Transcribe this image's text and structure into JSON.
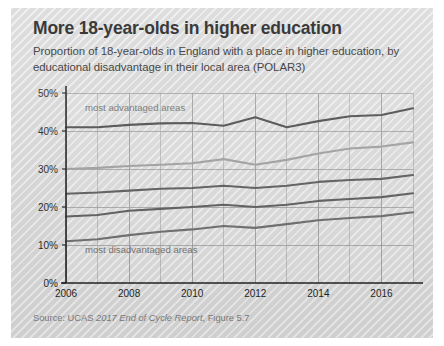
{
  "card": {
    "title": "More 18-year-olds in higher education",
    "subtitle": "Proportion of 18-year-olds in England with a place in higher education, by educational disadvantage in their local area (POLAR3)",
    "source_prefix": "Source: UCAS ",
    "source_italic": "2017 End of Cycle Report",
    "source_suffix": ", Figure 5.7",
    "background_color": "#d7d7d7"
  },
  "chart_data": {
    "type": "line",
    "title": "More 18-year-olds in higher education",
    "subtitle": "Proportion of 18-year-olds in England with a place in higher education, by educational disadvantage in their local area (POLAR3)",
    "xlabel": "",
    "ylabel": "",
    "x": [
      2006,
      2007,
      2008,
      2009,
      2010,
      2011,
      2012,
      2013,
      2014,
      2015,
      2016,
      2017
    ],
    "xlim": [
      2006,
      2017
    ],
    "ylim": [
      0,
      50
    ],
    "xticks": [
      2006,
      2008,
      2010,
      2012,
      2014,
      2016
    ],
    "xticklabels": [
      "2006",
      "2008",
      "2010",
      "2012",
      "2014",
      "2016"
    ],
    "yticks": [
      0,
      10,
      20,
      30,
      40,
      50
    ],
    "yticklabels": [
      "0%",
      "10%",
      "20%",
      "30%",
      "40%",
      "50%"
    ],
    "grid": true,
    "legend_position": "inline-annotations",
    "annotations": [
      {
        "text": "most advantaged areas",
        "x": 2006.6,
        "y": 45.3
      },
      {
        "text": "most disadvantaged areas",
        "x": 2006.6,
        "y": 8.0
      }
    ],
    "series": [
      {
        "name": "Quintile 5 (most advantaged areas)",
        "color": "#4a4a4a",
        "width": 2.1,
        "values": [
          41.0,
          41.0,
          41.6,
          42.0,
          42.1,
          41.4,
          43.6,
          41.0,
          42.6,
          43.9,
          44.2,
          46.0
        ]
      },
      {
        "name": "Quintile 4",
        "color": "#9e9e9e",
        "width": 2.1,
        "values": [
          30.0,
          30.3,
          30.8,
          31.1,
          31.5,
          32.6,
          31.1,
          32.4,
          34.1,
          35.4,
          35.9,
          37.0
        ]
      },
      {
        "name": "Quintile 3",
        "color": "#5a5a5a",
        "width": 2.1,
        "values": [
          23.5,
          23.8,
          24.3,
          24.8,
          25.0,
          25.6,
          25.0,
          25.6,
          26.6,
          27.1,
          27.4,
          28.4
        ]
      },
      {
        "name": "Quintile 2",
        "color": "#5a5a5a",
        "width": 2.1,
        "values": [
          17.5,
          17.9,
          19.0,
          19.5,
          20.0,
          20.6,
          20.0,
          20.6,
          21.6,
          22.1,
          22.6,
          23.6
        ]
      },
      {
        "name": "Quintile 1 (most disadvantaged areas)",
        "color": "#6a6a6a",
        "width": 2.1,
        "values": [
          11.0,
          11.5,
          12.6,
          13.5,
          14.1,
          15.0,
          14.5,
          15.5,
          16.5,
          17.1,
          17.6,
          18.6
        ]
      }
    ]
  }
}
